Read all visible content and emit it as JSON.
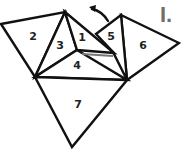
{
  "figure": {
    "label": "I.",
    "label_color": "#6e6e6e",
    "line_color": "#111111"
  },
  "triangles": [
    {
      "id": "1",
      "label": "1"
    },
    {
      "id": "2",
      "label": "2"
    },
    {
      "id": "3",
      "label": "3"
    },
    {
      "id": "4",
      "label": "4"
    },
    {
      "id": "5",
      "label": "5"
    },
    {
      "id": "6",
      "label": "6"
    },
    {
      "id": "7",
      "label": "7"
    }
  ],
  "arrow": {
    "icon": "curved-arrow-icon",
    "direction": "up-left"
  }
}
